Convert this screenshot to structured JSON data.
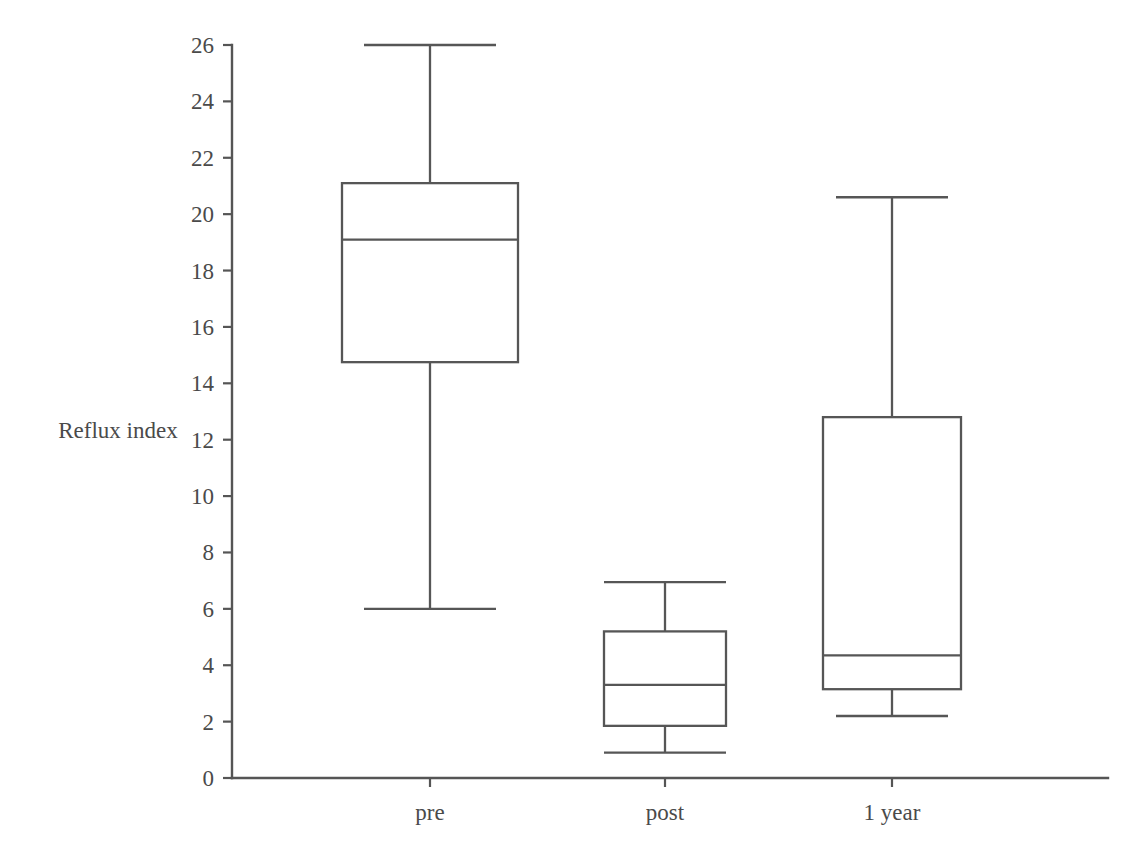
{
  "chart_data": {
    "type": "box",
    "title": "",
    "xlabel": "",
    "ylabel": "Reflux index",
    "ylim": [
      0,
      26
    ],
    "ytick_step": 2,
    "yticks": [
      "0",
      "2",
      "4",
      "6",
      "8",
      "10",
      "12",
      "14",
      "16",
      "18",
      "20",
      "22",
      "24",
      "26"
    ],
    "categories": [
      "pre",
      "post",
      "1 year"
    ],
    "grid": false,
    "legend": "none",
    "line_color": "#565656",
    "fill_color": "#ffffff",
    "background_color": "#ffffff",
    "boxes": [
      {
        "category": "pre",
        "whisker_low": 6.0,
        "q1": 14.75,
        "median": 19.1,
        "q3": 21.1,
        "whisker_high": 26.0
      },
      {
        "category": "post",
        "whisker_low": 0.9,
        "q1": 1.85,
        "median": 3.3,
        "q3": 5.2,
        "whisker_high": 6.95
      },
      {
        "category": "1 year",
        "whisker_low": 2.2,
        "q1": 3.15,
        "median": 4.35,
        "q3": 12.8,
        "whisker_high": 20.6
      }
    ]
  }
}
